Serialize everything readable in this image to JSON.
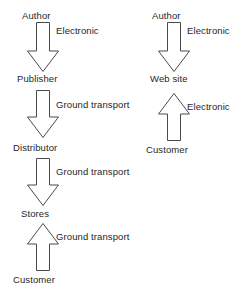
{
  "diagram": {
    "type": "flow-diagram",
    "background_color": "#ffffff",
    "stroke_color": "#4a4a4a",
    "fill_color": "#ffffff",
    "text_color": "#1f1f1f",
    "columns": [
      {
        "name": "traditional-print-chain",
        "nodes": [
          {
            "id": "author-left",
            "label": "Author"
          },
          {
            "id": "publisher",
            "label": "Publisher"
          },
          {
            "id": "distributor",
            "label": "Distributor"
          },
          {
            "id": "stores",
            "label": "Stores"
          },
          {
            "id": "customer-left",
            "label": "Customer"
          }
        ],
        "edges": [
          {
            "id": "author-to-publisher",
            "label": "Electronic",
            "direction": "down"
          },
          {
            "id": "publisher-to-distributor",
            "label": "Ground transport",
            "direction": "down"
          },
          {
            "id": "distributor-to-stores",
            "label": "Ground transport",
            "direction": "down"
          },
          {
            "id": "customer-to-stores",
            "label": "Ground transport",
            "direction": "up"
          }
        ]
      },
      {
        "name": "electronic-chain",
        "nodes": [
          {
            "id": "author-right",
            "label": "Author"
          },
          {
            "id": "web-site",
            "label": "Web site"
          },
          {
            "id": "customer-right",
            "label": "Customer"
          }
        ],
        "edges": [
          {
            "id": "author-to-website",
            "label": "Electronic",
            "direction": "down"
          },
          {
            "id": "customer-to-website",
            "label": "Electronic",
            "direction": "up"
          }
        ]
      }
    ]
  }
}
